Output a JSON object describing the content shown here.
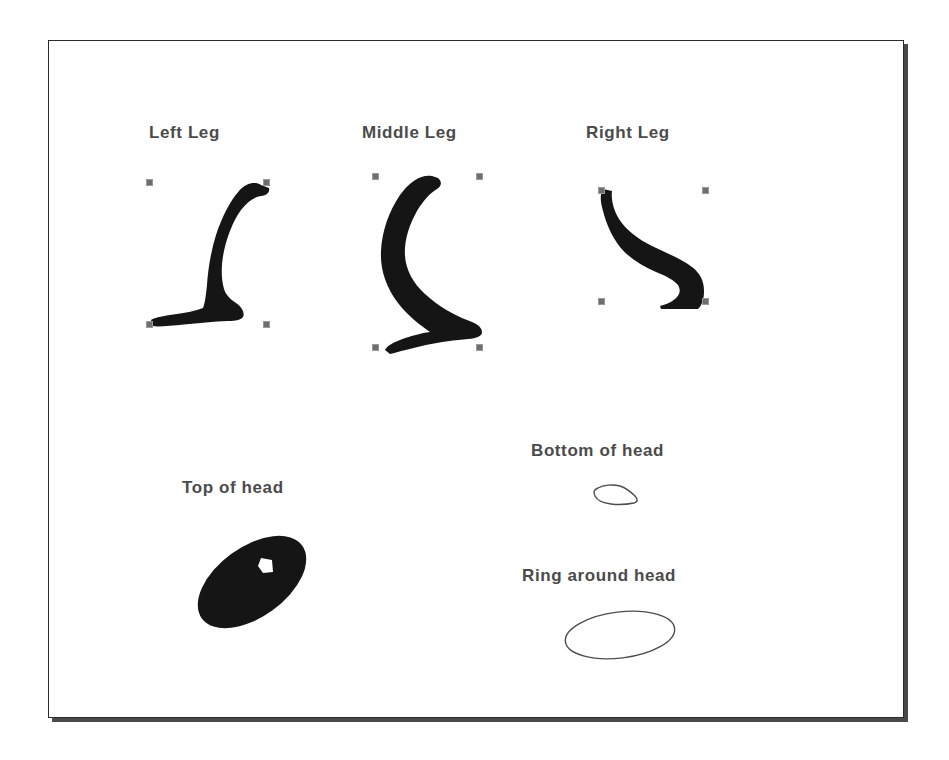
{
  "figure": {
    "background_color": "#ffffff",
    "frame_border_color": "#2b2b2b",
    "frame_shadow_color": "#4a4a4a",
    "label_color": "#4b4b4b",
    "shape_fill_color": "#151515",
    "outline_stroke_color": "#4d4d4d",
    "handle_fill_color": "#6e6e6e",
    "handle_border_color": "#9a9a9a"
  },
  "parts": [
    {
      "id": "left-leg",
      "label": "Left Leg",
      "label_x": 148,
      "label_y": 122,
      "selected": true,
      "fill": "solid",
      "bbox": {
        "x": 145,
        "y": 178,
        "w": 117,
        "h": 142
      }
    },
    {
      "id": "middle-leg",
      "label": "Middle Leg",
      "label_x": 361,
      "label_y": 122,
      "selected": true,
      "fill": "solid",
      "bbox": {
        "x": 371,
        "y": 172,
        "w": 104,
        "h": 171
      }
    },
    {
      "id": "right-leg",
      "label": "Right Leg",
      "label_x": 585,
      "label_y": 122,
      "selected": true,
      "fill": "solid",
      "bbox": {
        "x": 597,
        "y": 186,
        "w": 105,
        "h": 111
      }
    },
    {
      "id": "top-of-head",
      "label": "Top of head",
      "label_x": 181,
      "label_y": 477,
      "selected": false,
      "fill": "solid",
      "bbox": {
        "x": 189,
        "y": 533,
        "w": 124,
        "h": 95
      }
    },
    {
      "id": "bottom-of-head",
      "label": "Bottom of head",
      "label_x": 530,
      "label_y": 440,
      "selected": false,
      "fill": "outline",
      "bbox": {
        "x": 592,
        "y": 484,
        "w": 44,
        "h": 22
      }
    },
    {
      "id": "ring-around-head",
      "label": "Ring around head",
      "label_x": 521,
      "label_y": 565,
      "selected": false,
      "fill": "outline",
      "bbox": {
        "x": 563,
        "y": 610,
        "w": 110,
        "h": 48
      }
    }
  ]
}
